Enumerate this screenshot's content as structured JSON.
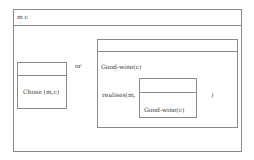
{
  "diagram": {
    "type": "DRS",
    "outer": {
      "universe": "m c",
      "conditions": [
        "disjunction"
      ]
    },
    "left_box": {
      "universe": "",
      "condition": "Chose (m,c)"
    },
    "connector": "or",
    "right_box": {
      "universe": "",
      "condition_1": "Good-wine(c)",
      "condition_2_prefix": "realises(m,",
      "condition_2_suffix": ")",
      "nested_box": {
        "universe": "",
        "condition": "Good-wine(c)"
      }
    }
  },
  "colors": {
    "line": "#8a8a8a",
    "text": "#3a3a3a",
    "background": "#ffffff"
  }
}
